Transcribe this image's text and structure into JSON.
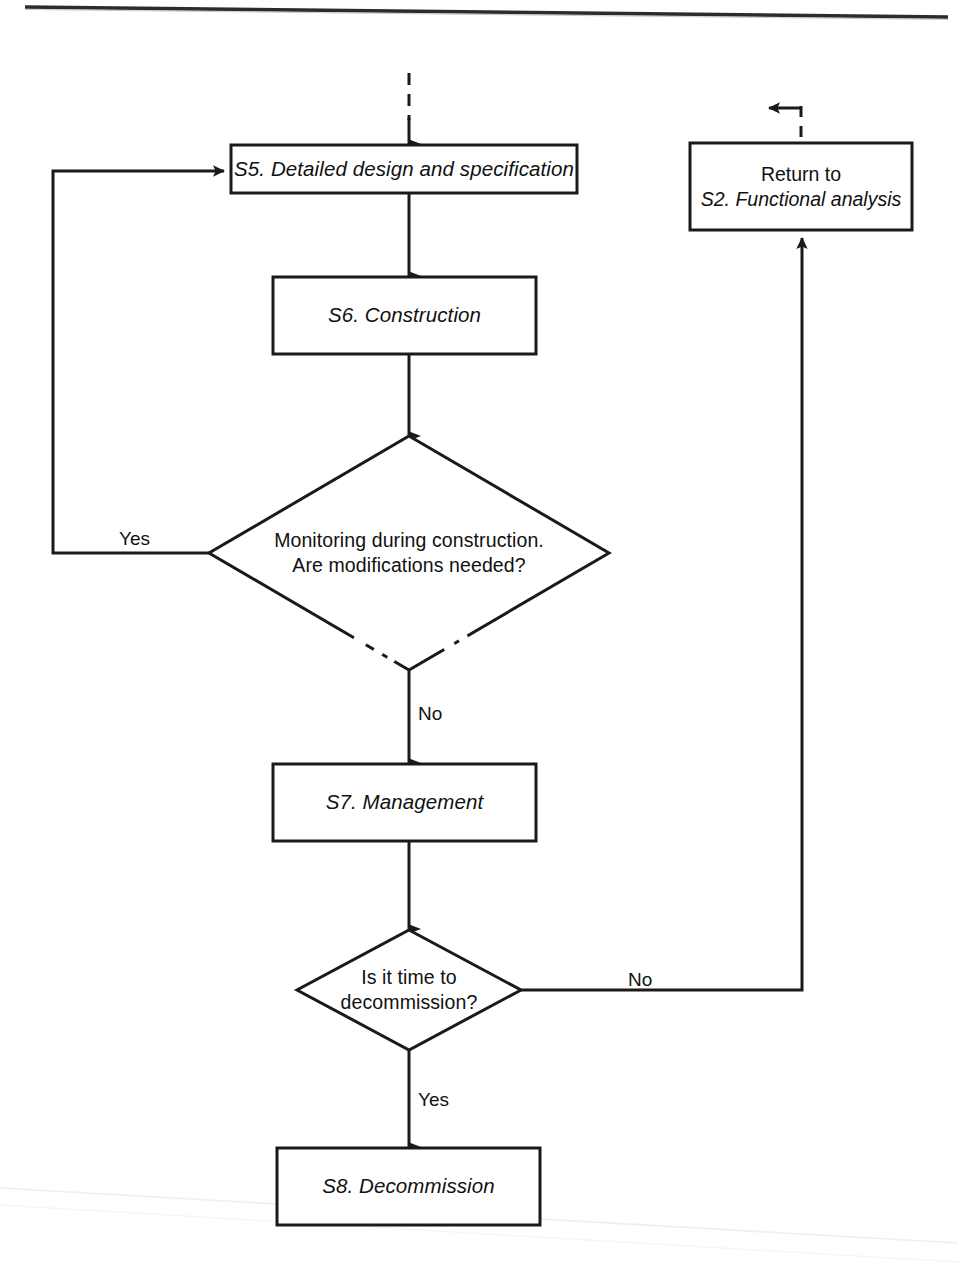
{
  "diagram": {
    "type": "flowchart",
    "stroke_color": "#1a1a1a",
    "fill_color": "#ffffff",
    "background_color": "#ffffff",
    "nodes": [
      {
        "id": "s5",
        "shape": "process",
        "label": "S5. Detailed design and specification",
        "style": "italic",
        "x": 231,
        "y": 145,
        "w": 346,
        "h": 48
      },
      {
        "id": "s6",
        "shape": "process",
        "label": "S6. Construction",
        "style": "italic",
        "x": 273,
        "y": 277,
        "w": 263,
        "h": 77
      },
      {
        "id": "d1",
        "shape": "decision",
        "label": "Monitoring during construction.\nAre modifications needed?",
        "style": "normal",
        "cx": 409,
        "cy": 553,
        "rx": 200,
        "ry": 117
      },
      {
        "id": "s7",
        "shape": "process",
        "label": "S7. Management",
        "style": "italic",
        "x": 273,
        "y": 764,
        "w": 263,
        "h": 77
      },
      {
        "id": "d2",
        "shape": "decision",
        "label": "Is it time to\ndecommission?",
        "style": "normal",
        "cx": 409,
        "cy": 990,
        "rx": 112,
        "ry": 60
      },
      {
        "id": "s8",
        "shape": "process",
        "label": "S8. Decommission",
        "style": "italic",
        "x": 277,
        "y": 1148,
        "w": 263,
        "h": 77
      },
      {
        "id": "ret",
        "shape": "process",
        "label": "Return to\nS2. Functional analysis",
        "label_line_1": "Return to",
        "label_line_2": "S2. Functional analysis",
        "style": "mixed",
        "x": 690,
        "y": 143,
        "w": 222,
        "h": 87
      }
    ],
    "edges": [
      {
        "id": "e-in-s5",
        "from": "(entry)",
        "to": "s5",
        "style": "dashed",
        "arrow": "down"
      },
      {
        "id": "e-s5-s6",
        "from": "s5",
        "to": "s6",
        "style": "solid",
        "arrow": "down"
      },
      {
        "id": "e-s6-d1",
        "from": "s6",
        "to": "d1",
        "style": "solid",
        "arrow": "down"
      },
      {
        "id": "e-d1-yes",
        "from": "d1",
        "to": "s5",
        "style": "solid",
        "arrow": "right",
        "label": "Yes"
      },
      {
        "id": "e-d1-no",
        "from": "d1",
        "to": "s7",
        "style": "solid",
        "arrow": "down",
        "label": "No"
      },
      {
        "id": "e-s7-d2",
        "from": "s7",
        "to": "d2",
        "style": "solid",
        "arrow": "down"
      },
      {
        "id": "e-d2-no",
        "from": "d2",
        "to": "ret",
        "style": "solid",
        "arrow": "up",
        "label": "No"
      },
      {
        "id": "e-d2-yes",
        "from": "d2",
        "to": "s8",
        "style": "solid",
        "arrow": "down",
        "label": "Yes"
      },
      {
        "id": "e-ret-out",
        "from": "ret",
        "to": "(exit)",
        "style": "dashed",
        "arrow": "up"
      }
    ],
    "edge_labels": {
      "yes_modifications": "Yes",
      "no_modifications": "No",
      "no_decommission": "No",
      "yes_decommission": "Yes"
    },
    "page_rule": {
      "name": "top-horizontal-rule",
      "present": true
    }
  }
}
